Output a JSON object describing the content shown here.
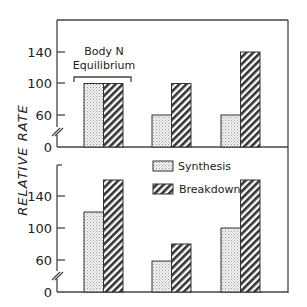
{
  "chart_data": [
    {
      "type": "bar",
      "panel": "top",
      "title": "",
      "ylabel": "RELATIVE RATE",
      "xlabel": "",
      "yticks": [
        0,
        60,
        100,
        140
      ],
      "ylim": [
        0,
        180
      ],
      "axis_break": true,
      "categories": [
        "Body N Equilibrium",
        "Group 2",
        "Group 3"
      ],
      "series": [
        {
          "name": "Synthesis",
          "values": [
            100,
            60,
            60
          ]
        },
        {
          "name": "Breakdown",
          "values": [
            100,
            100,
            140
          ]
        }
      ],
      "annotations": [
        {
          "text": "Body N Equilibrium",
          "target": "group 1",
          "type": "bracket"
        }
      ]
    },
    {
      "type": "bar",
      "panel": "bottom",
      "title": "",
      "ylabel": "RELATIVE RATE",
      "xlabel": "",
      "yticks": [
        0,
        60,
        100,
        140
      ],
      "ylim": [
        0,
        180
      ],
      "axis_break": true,
      "categories": [
        "Group 1",
        "Group 2",
        "Group 3"
      ],
      "series": [
        {
          "name": "Synthesis",
          "values": [
            120,
            58,
            100
          ]
        },
        {
          "name": "Breakdown",
          "values": [
            160,
            80,
            160
          ]
        }
      ],
      "legend": {
        "position": "upper right",
        "entries": [
          "Synthesis",
          "Breakdown"
        ]
      }
    }
  ],
  "labels": {
    "ylabel": "RELATIVE RATE",
    "annotation_line1": "Body N",
    "annotation_line2": "Equilibrium",
    "legend_synthesis": "Synthesis",
    "legend_breakdown": "Breakdown",
    "tick_0": "0",
    "tick_60": "60",
    "tick_100": "100",
    "tick_140": "140"
  }
}
